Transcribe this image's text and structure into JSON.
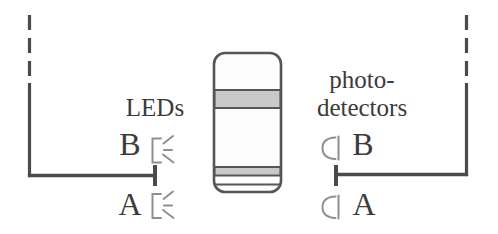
{
  "colors": {
    "background": "#ffffff",
    "wire": "#4a4a4a",
    "text": "#3b3b3b",
    "icon_stroke": "#8f8f8f",
    "drum_outline": "#565656",
    "drum_band_fill": "#c9c9c9"
  },
  "left": {
    "label": "LEDs",
    "channels": [
      {
        "letter": "B"
      },
      {
        "letter": "A"
      }
    ]
  },
  "right": {
    "label_line1": "photo-",
    "label_line2": "detectors",
    "channels": [
      {
        "letter": "B"
      },
      {
        "letter": "A"
      }
    ]
  }
}
